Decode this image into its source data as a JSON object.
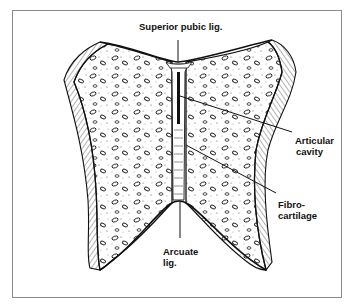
{
  "diagram": {
    "labels": {
      "superior_pubic_lig": "Superior pubic lig.",
      "articular_cavity": {
        "line1": "Articular",
        "line2": "cavity"
      },
      "fibrocartilage": {
        "line1": "Fibro-",
        "line2": "cartilage"
      },
      "arcuate_lig": {
        "line1": "Arcuate",
        "line2": "lig."
      }
    },
    "colors": {
      "ink": "#111111",
      "border": "#8a8a8a",
      "background": "#ffffff"
    }
  }
}
